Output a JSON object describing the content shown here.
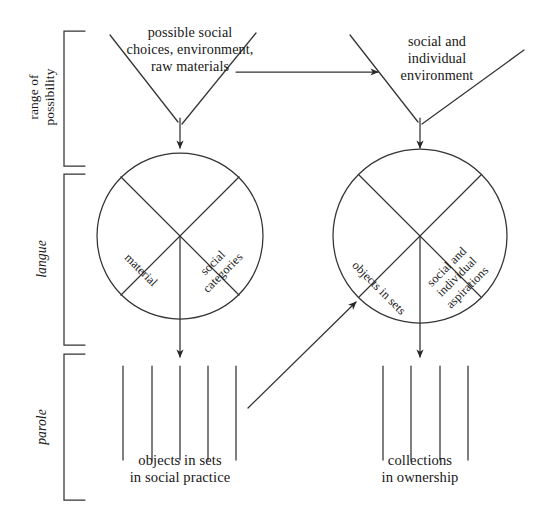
{
  "diagram": {
    "title_text_blocks": {
      "top_left": "possible social\nchoices, environment,\nraw materials",
      "top_right": "social and\nindividual\nenvironment",
      "bottom_left": "objects in sets\nin social practice",
      "bottom_right": "collections\nin ownership"
    },
    "bracket_labels": {
      "range_of_possibility": "range of\npossibility",
      "langue": "langue",
      "parole": "parole"
    },
    "left_circle_quadrant_labels": {
      "left": "material",
      "right": "social\ncategories"
    },
    "right_circle_quadrant_labels": {
      "left": "objects in sets",
      "right": "social and\nindividual\naspirations"
    },
    "colors": {
      "ink": "#1a1a1a",
      "background": "#ffffff",
      "stroke": "#333333"
    },
    "counts": {
      "left_parole_ticks": 5,
      "right_parole_ticks": 4,
      "circles": 2,
      "brackets": 3
    }
  }
}
